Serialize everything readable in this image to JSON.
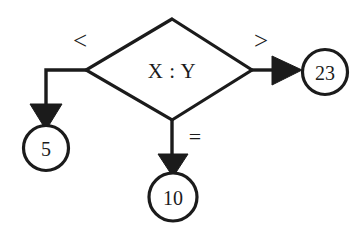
{
  "diagram": {
    "background_color": "#ffffff",
    "stroke_color": "#1b1b1b",
    "decision": {
      "label": "X : Y",
      "shape": "diamond"
    },
    "branches": [
      {
        "label": "<",
        "target_value": "5",
        "direction": "left"
      },
      {
        "label": "=",
        "target_value": "10",
        "direction": "down"
      },
      {
        "label": ">",
        "target_value": "23",
        "direction": "right"
      }
    ],
    "terminals": {
      "less_than": "5",
      "equal": "10",
      "greater_than": "23"
    }
  }
}
